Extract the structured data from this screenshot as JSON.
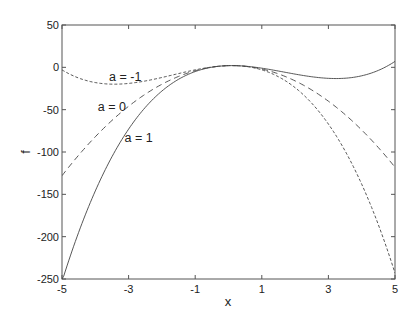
{
  "chart_data": {
    "type": "line",
    "title": "",
    "xlabel": "x",
    "ylabel": "f",
    "xlim": [
      -5,
      5
    ],
    "ylim": [
      -250,
      50
    ],
    "xticks": [
      -5,
      -3,
      -1,
      1,
      3,
      5
    ],
    "yticks": [
      50,
      0,
      -50,
      -100,
      -150,
      -200,
      -250
    ],
    "xtick_labels": [
      "-5",
      "-3",
      "-1",
      "1",
      "3",
      "5"
    ],
    "ytick_labels": [
      "50",
      "0",
      "-50",
      "-100",
      "-150",
      "-200",
      "-250"
    ],
    "grid": false,
    "legend": null,
    "formula_estimate": "f = 2 + x - 5x^2 + a*x^3",
    "x": [
      -5,
      -4.5,
      -4,
      -3.5,
      -3,
      -2.5,
      -2,
      -1.5,
      -1,
      -0.5,
      0,
      0.5,
      1,
      1.5,
      2,
      2.5,
      3,
      3.5,
      4,
      4.5,
      5
    ],
    "series": [
      {
        "name": "a = -1",
        "style": "dotted-dash",
        "values": [
          -3,
          -12.6,
          -18,
          -19.4,
          -16,
          -10.1,
          -4,
          0.6,
          2,
          1.4,
          2,
          1.9,
          -3,
          -11.1,
          -24,
          -40.4,
          -61,
          -85.6,
          -114,
          -146.4,
          -253
        ]
      },
      {
        "name": "a = 0",
        "style": "dashed",
        "values": [
          -128,
          -103.8,
          -82,
          -62.8,
          -46,
          -31.8,
          -20,
          -10.8,
          -4,
          0.3,
          2,
          1.3,
          -2,
          -7.8,
          -16,
          -26.8,
          -40,
          -55.8,
          -74,
          -94.8,
          -118
        ]
      },
      {
        "name": "a = 1",
        "style": "solid",
        "values": [
          -253,
          -195,
          -146,
          -105.6,
          -73,
          -47.4,
          -28,
          -14.1,
          -5,
          0.1,
          2,
          1.4,
          -1,
          -4.4,
          -8,
          -11.1,
          -13,
          -12.9,
          -10,
          -3.7,
          7
        ]
      }
    ],
    "annotations": [
      {
        "text": "a = -1",
        "x": -3.1,
        "y": -16
      },
      {
        "text": "a = 0",
        "x": -3.5,
        "y": -52
      },
      {
        "text": "a = 1",
        "x": -2.7,
        "y": -88
      }
    ]
  },
  "colors": {
    "axis": "#555555",
    "line": "#444444",
    "background": "#ffffff"
  }
}
